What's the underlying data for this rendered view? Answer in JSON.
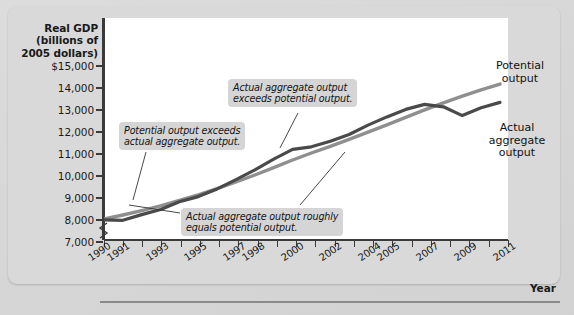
{
  "figure": {
    "axis_title_y": "Real GDP\n(billions of\n2005 dollars)",
    "axis_title_x": "Year",
    "colors": {
      "potential_line": "#8f8f8f",
      "actual_line": "#4a4a4a",
      "panel_background": "#d9d9d9",
      "plot_background": "#ffffff",
      "axis": "#3a3a3a",
      "callout_background": "#d5d5d5"
    }
  },
  "chart_data": {
    "type": "line",
    "title": "",
    "xlabel": "Year",
    "ylabel": "Real GDP (billions of 2005 dollars)",
    "ylim": [
      7000,
      15000
    ],
    "yticks": [
      "$15,000",
      "14,000",
      "13,000",
      "12,000",
      "11,000",
      "10,000",
      "9,000",
      "8,000",
      "7,000"
    ],
    "ytick_values": [
      15000,
      14000,
      13000,
      12000,
      11000,
      10000,
      9000,
      8000,
      7000
    ],
    "grid": false,
    "axis_break_y": true,
    "legend": "inline-labels",
    "x": [
      1990,
      1991,
      1992,
      1993,
      1994,
      1995,
      1996,
      1997,
      1998,
      1999,
      2000,
      2001,
      2002,
      2003,
      2004,
      2005,
      2006,
      2007,
      2008,
      2009,
      2010,
      2011
    ],
    "xticks_labeled": [
      "1990",
      "1991",
      "1993",
      "1995",
      "1997",
      "1998",
      "2000",
      "2002",
      "2004",
      "2005",
      "2007",
      "2009",
      "2011"
    ],
    "series": [
      {
        "name": "Potential output",
        "color": "#8f8f8f",
        "values": [
          8000,
          8180,
          8380,
          8600,
          8850,
          9100,
          9380,
          9680,
          10000,
          10330,
          10680,
          11000,
          11300,
          11620,
          11950,
          12280,
          12620,
          12960,
          13280,
          13580,
          13870,
          14130
        ]
      },
      {
        "name": "Actual aggregate output",
        "color": "#4a4a4a",
        "values": [
          7960,
          7940,
          8200,
          8430,
          8780,
          9020,
          9370,
          9790,
          10230,
          10720,
          11170,
          11280,
          11530,
          11840,
          12270,
          12640,
          12980,
          13210,
          13100,
          12700,
          13060,
          13300
        ]
      }
    ],
    "annotations": [
      {
        "id": "potential-exceeds",
        "text": "Potential output exceeds\nactual aggregate output.",
        "points_to_year": 1992
      },
      {
        "id": "actual-exceeds",
        "text": "Actual aggregate output\nexceeds potential output.",
        "points_to_year": 2000
      },
      {
        "id": "roughly-equals",
        "text": "Actual aggregate output roughly\nequals potential output.",
        "points_to_years": [
          1991,
          2002
        ]
      },
      {
        "id": "potential-output-label",
        "text": "Potential\noutput"
      },
      {
        "id": "actual-output-label",
        "text": "Actual\naggregate\noutput"
      }
    ]
  }
}
